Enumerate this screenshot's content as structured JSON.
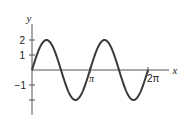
{
  "chart_data": {
    "type": "line",
    "title": "",
    "xlabel": "x",
    "ylabel": "y",
    "function": "y = 2 sin(2x)",
    "xlim": [
      0,
      6.2832
    ],
    "ylim": [
      -2,
      2
    ],
    "grid": false,
    "legend": null,
    "x_ticks": [
      {
        "value": 3.1416,
        "label": "π"
      },
      {
        "value": 6.2832,
        "label": "2π"
      }
    ],
    "y_ticks": [
      {
        "value": 2,
        "label": "2"
      },
      {
        "value": 1,
        "label": "1"
      },
      {
        "value": -1,
        "label": "−1"
      },
      {
        "value": -2,
        "label": ""
      }
    ],
    "series": [
      {
        "name": "2 sin 2x",
        "x": [
          0,
          0.7854,
          1.5708,
          2.3562,
          3.1416,
          3.927,
          4.7124,
          5.4978,
          6.2832
        ],
        "values": [
          0,
          2,
          0,
          -2,
          0,
          2,
          0,
          -2,
          0
        ]
      }
    ]
  },
  "labels": {
    "x_axis": "x",
    "y_axis": "y",
    "tick_pi": "π",
    "tick_2pi": "2π",
    "tick_y2": "2",
    "tick_y1": "1",
    "tick_ym1": "−1"
  },
  "colors": {
    "curve": "#3a3a3a",
    "axis": "#555555"
  }
}
